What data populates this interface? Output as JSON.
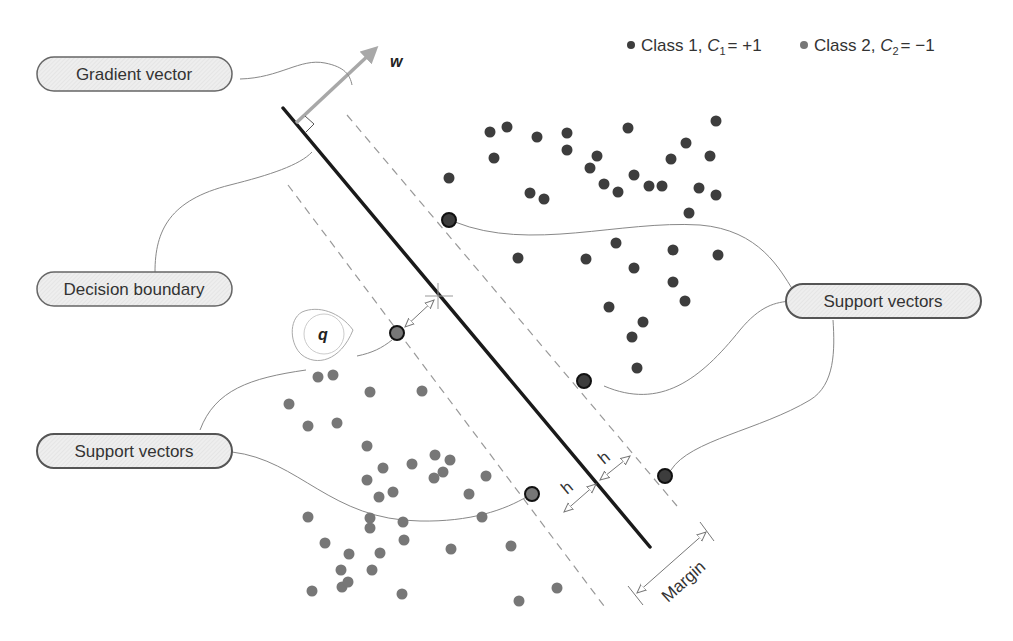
{
  "legend": {
    "class1": {
      "label": "Class 1, ",
      "symbol": "C",
      "subscript": "1",
      "value": "= +1",
      "color": "#3d3d3d"
    },
    "class2": {
      "label": "Class 2, ",
      "symbol": "C",
      "subscript": "2",
      "value": "= −1",
      "color": "#777777"
    }
  },
  "labels": {
    "gradient_vector": "Gradient vector",
    "decision_boundary": "Decision boundary",
    "support_vectors_left": "Support vectors",
    "support_vectors_right": "Support vectors",
    "w": "w",
    "q": "q",
    "h1": "h",
    "h2": "h",
    "margin": "Margin"
  },
  "colors": {
    "class1": "#3d3d3d",
    "class2": "#777777",
    "boundary": "#1a1a1a",
    "gradient": "#a8a8a8",
    "pill_fill": "#ececec",
    "pill_stroke": "#555555",
    "connector": "#888888",
    "dashed": "#999999"
  },
  "points": {
    "class1": [
      [
        490,
        132
      ],
      [
        507,
        127
      ],
      [
        537,
        137
      ],
      [
        567,
        133
      ],
      [
        628,
        128
      ],
      [
        716,
        121
      ],
      [
        494,
        158
      ],
      [
        567,
        150
      ],
      [
        597,
        156
      ],
      [
        671,
        159
      ],
      [
        686,
        143
      ],
      [
        710,
        156
      ],
      [
        590,
        168
      ],
      [
        634,
        175
      ],
      [
        449,
        178
      ],
      [
        604,
        184
      ],
      [
        618,
        192
      ],
      [
        649,
        186
      ],
      [
        662,
        186
      ],
      [
        699,
        188
      ],
      [
        716,
        195
      ],
      [
        530,
        193
      ],
      [
        544,
        199
      ],
      [
        689,
        213
      ],
      [
        616,
        243
      ],
      [
        673,
        250
      ],
      [
        718,
        255
      ],
      [
        518,
        258
      ],
      [
        586,
        259
      ],
      [
        634,
        268
      ],
      [
        673,
        282
      ],
      [
        685,
        301
      ],
      [
        609,
        307
      ],
      [
        643,
        322
      ],
      [
        632,
        337
      ],
      [
        637,
        368
      ]
    ],
    "class2": [
      [
        318,
        377
      ],
      [
        333,
        375
      ],
      [
        370,
        392
      ],
      [
        422,
        391
      ],
      [
        289,
        404
      ],
      [
        308,
        426
      ],
      [
        337,
        423
      ],
      [
        367,
        446
      ],
      [
        383,
        468
      ],
      [
        412,
        464
      ],
      [
        435,
        455
      ],
      [
        443,
        472
      ],
      [
        450,
        460
      ],
      [
        367,
        480
      ],
      [
        393,
        492
      ],
      [
        379,
        497
      ],
      [
        469,
        494
      ],
      [
        434,
        478
      ],
      [
        486,
        476
      ],
      [
        482,
        517
      ],
      [
        308,
        517
      ],
      [
        370,
        518
      ],
      [
        370,
        528
      ],
      [
        403,
        522
      ],
      [
        325,
        543
      ],
      [
        349,
        554
      ],
      [
        380,
        553
      ],
      [
        404,
        540
      ],
      [
        451,
        549
      ],
      [
        511,
        546
      ],
      [
        341,
        570
      ],
      [
        372,
        570
      ],
      [
        342,
        587
      ],
      [
        312,
        591
      ],
      [
        348,
        582
      ],
      [
        402,
        594
      ],
      [
        519,
        601
      ],
      [
        557,
        588
      ]
    ]
  },
  "support_vectors": {
    "class1": [
      [
        449,
        220
      ],
      [
        584,
        381
      ],
      [
        665,
        476
      ]
    ],
    "class2": [
      [
        397,
        333
      ],
      [
        532,
        494
      ]
    ]
  }
}
